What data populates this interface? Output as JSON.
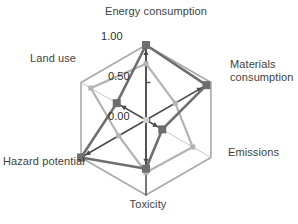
{
  "chart_data": {
    "type": "radar",
    "title": "",
    "categories": [
      "Energy consumption",
      "Materials consumption",
      "Emissions",
      "Toxicity",
      "Hazard potential",
      "Land use"
    ],
    "tick_labels": [
      "0.00",
      "0.50",
      "1.00"
    ],
    "rlim": [
      0,
      1
    ],
    "grid": true,
    "legend": "none",
    "series": [
      {
        "name": "dark-series",
        "color": "#6e6e6e",
        "values": [
          1.0,
          0.93,
          0.25,
          0.65,
          1.0,
          0.45
        ]
      },
      {
        "name": "light-series",
        "color": "#b4b4b4",
        "values": [
          0.75,
          0.45,
          0.72,
          0.7,
          0.42,
          0.85
        ]
      }
    ],
    "axis_labels": {
      "energy": "Energy consumption",
      "materials": "Materials\nconsumption",
      "emissions": "Emissions",
      "toxicity": "Toxicity",
      "hazard": "Hazard potential",
      "land_use": "Land use"
    },
    "ticks": {
      "outer": "1.00",
      "mid": "0.50",
      "center": "0.00"
    },
    "colors": {
      "grid": "#a9a9a9",
      "dark_series": "#6e6e6e",
      "light_series": "#b4b4b4",
      "spoke": "#4a4a4a",
      "text": "#3f3f3f",
      "background": "#ffffff"
    }
  }
}
